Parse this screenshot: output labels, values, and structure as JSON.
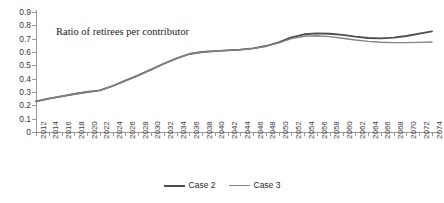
{
  "chart_data": {
    "type": "line",
    "title": "Ratio of retirees per contributor",
    "xlabel": "",
    "ylabel": "",
    "ylim": [
      0,
      0.9
    ],
    "ytick_labels": [
      "0.9",
      "0.8",
      "0.7",
      "0.6",
      "0.5",
      "0.4",
      "0.3",
      "0.2",
      "0.1",
      "0"
    ],
    "ytick_values": [
      0.9,
      0.8,
      0.7,
      0.6,
      0.5,
      0.4,
      0.3,
      0.2,
      0.1,
      0
    ],
    "grid": false,
    "legend_position": "bottom-center",
    "x": [
      2012,
      2014,
      2016,
      2018,
      2020,
      2022,
      2024,
      2026,
      2028,
      2030,
      2032,
      2034,
      2036,
      2038,
      2040,
      2042,
      2044,
      2046,
      2048,
      2050,
      2052,
      2054,
      2056,
      2058,
      2060,
      2062,
      2064,
      2066,
      2068,
      2070,
      2072,
      2074
    ],
    "categories": [
      "2012",
      "2014",
      "2016",
      "2018",
      "2020",
      "2022",
      "2024",
      "2026",
      "2028",
      "2030",
      "2032",
      "2034",
      "2036",
      "2038",
      "2040",
      "2042",
      "2044",
      "2046",
      "2048",
      "2050",
      "2052",
      "2054",
      "2056",
      "2058",
      "2060",
      "2062",
      "2064",
      "2066",
      "2068",
      "2070",
      "2072",
      "2074"
    ],
    "series": [
      {
        "name": "Case 2",
        "color": "#4d4d4d",
        "values": [
          0.23,
          0.25,
          0.268,
          0.285,
          0.3,
          0.312,
          0.345,
          0.385,
          0.425,
          0.468,
          0.512,
          0.552,
          0.585,
          0.6,
          0.607,
          0.612,
          0.618,
          0.627,
          0.645,
          0.672,
          0.71,
          0.733,
          0.74,
          0.737,
          0.728,
          0.715,
          0.705,
          0.702,
          0.708,
          0.72,
          0.738,
          0.755
        ]
      },
      {
        "name": "Case 3",
        "color": "#848484",
        "values": [
          0.23,
          0.25,
          0.268,
          0.285,
          0.3,
          0.312,
          0.345,
          0.385,
          0.425,
          0.468,
          0.512,
          0.552,
          0.585,
          0.6,
          0.607,
          0.612,
          0.618,
          0.627,
          0.643,
          0.668,
          0.7,
          0.718,
          0.722,
          0.715,
          0.703,
          0.69,
          0.68,
          0.673,
          0.67,
          0.67,
          0.672,
          0.675
        ]
      }
    ]
  },
  "legend": {
    "items": [
      {
        "label": "Case 2"
      },
      {
        "label": "Case 3"
      }
    ]
  }
}
